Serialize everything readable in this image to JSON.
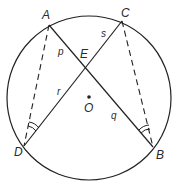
{
  "diagram": {
    "circle": {
      "center_label": "O",
      "cx": 89,
      "cy": 98,
      "r": 82
    },
    "points": {
      "A": {
        "label": "A",
        "x": 49,
        "y": 25
      },
      "B": {
        "label": "B",
        "x": 153,
        "y": 147
      },
      "C": {
        "label": "C",
        "x": 122,
        "y": 21
      },
      "D": {
        "label": "D",
        "x": 24,
        "y": 146
      },
      "E": {
        "label": "E",
        "x": 86,
        "y": 67
      },
      "O": {
        "label": "O",
        "x": 89,
        "y": 97
      }
    },
    "chords": [
      {
        "from": "A",
        "to": "B",
        "style": "solid"
      },
      {
        "from": "C",
        "to": "D",
        "style": "solid"
      }
    ],
    "dashed_segments": [
      {
        "from": "A",
        "to": "D"
      },
      {
        "from": "C",
        "to": "B"
      }
    ],
    "segment_labels": {
      "p": "p",
      "q": "q",
      "r": "r",
      "s": "s"
    },
    "equal_angle_marks": [
      {
        "vertex": "D",
        "arcs": 2
      },
      {
        "vertex": "B",
        "arcs": 2
      }
    ],
    "colors": {
      "stroke": "#222222",
      "text": "#2a2a2a",
      "background": "#ffffff"
    }
  }
}
